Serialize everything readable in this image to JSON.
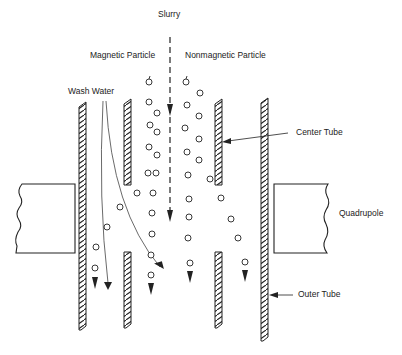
{
  "diagram": {
    "type": "magnetic separator schematic",
    "labels": {
      "slurry": "Slurry",
      "magnetic_particle": "Magnetic Particle",
      "nonmagnetic_particle": "Nonmagnetic Particle",
      "wash_water": "Wash Water",
      "center_tube": "Center Tube",
      "quadrupole": "Quadrupole",
      "outer_tube": "Outer Tube"
    },
    "colors": {
      "line": "#222222",
      "background": "#ffffff"
    },
    "components": [
      {
        "name": "outer-tube",
        "walls": 2
      },
      {
        "name": "center-tube",
        "walls": 2,
        "segments": [
          "upper",
          "lower"
        ]
      },
      {
        "name": "quadrupole",
        "poles_visible": 2
      },
      {
        "name": "slurry-flow",
        "style": "dashed arrow down"
      },
      {
        "name": "wash-water-flow",
        "style": "curved arrows"
      }
    ]
  }
}
